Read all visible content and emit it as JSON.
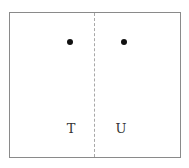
{
  "diagram": {
    "regions": [
      {
        "id": "left",
        "label": "T",
        "point": {
          "x": 69,
          "y": 41
        }
      },
      {
        "id": "right",
        "label": "U",
        "point": {
          "x": 123,
          "y": 41
        }
      }
    ],
    "divider_style": "dashed",
    "colors": {
      "border": "#8a8a8a",
      "divider": "#a8a8a8",
      "dot": "#111111",
      "text": "#333333"
    }
  }
}
